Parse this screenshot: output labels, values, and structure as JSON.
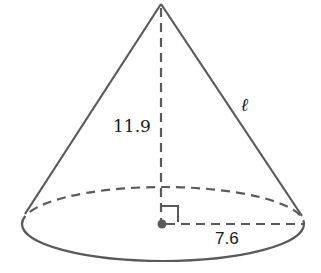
{
  "diagram": {
    "type": "right circular cone",
    "colors": {
      "stroke": "#5a5a5a",
      "text": "#1a1a1a",
      "background": "#ffffff"
    },
    "labels": {
      "height": "11.9",
      "radius": "7.6",
      "slant_height": "ℓ"
    },
    "geometry": {
      "apex": [
        161,
        4
      ],
      "base_center": [
        162,
        224
      ],
      "base_rx": 141,
      "base_ry": 37,
      "radius_end": [
        303,
        224
      ]
    },
    "marks": {
      "right_angle": true,
      "center_point": true
    }
  }
}
